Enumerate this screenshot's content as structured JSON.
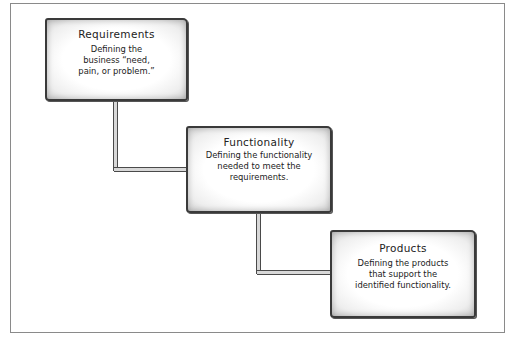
{
  "diagram": {
    "type": "staircase-flow",
    "steps": [
      {
        "title": "Requirements",
        "description": "Defining the business “need, pain, or problem.”",
        "lines": [
          "Defining the",
          "business “need,",
          "pain, or problem.”"
        ]
      },
      {
        "title": "Functionality",
        "description": "Defining the functionality needed to meet the requirements.",
        "lines": [
          "Defining the functionality",
          "needed to meet the",
          "requirements."
        ]
      },
      {
        "title": "Products",
        "description": "Defining the products that support the identified functionality.",
        "lines": [
          "Defining the products",
          "that support the",
          "identified functionality."
        ]
      }
    ],
    "connections": [
      {
        "from": "Requirements",
        "to": "Functionality"
      },
      {
        "from": "Functionality",
        "to": "Products"
      }
    ],
    "colors": {
      "border": "#3a3a3a",
      "fill": "#ffffff",
      "frame": "#8a8a8a",
      "text": "#222222"
    }
  }
}
